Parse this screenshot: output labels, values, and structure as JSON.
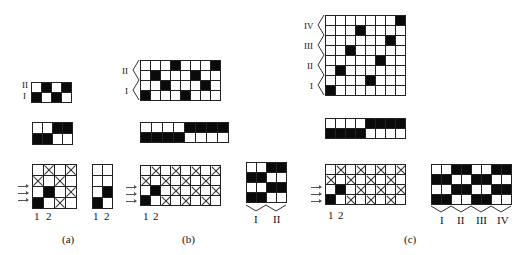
{
  "figure": {
    "panels": [
      {
        "id": "a",
        "caption": "(a)",
        "threading": {
          "rows": 2,
          "cols": 4,
          "row_labels": [
            "II",
            "I"
          ],
          "cells": [
            [
              0,
              1,
              0,
              1
            ],
            [
              1,
              0,
              1,
              0
            ]
          ]
        },
        "tieup": {
          "rows": 2,
          "cols": 4,
          "cells": [
            [
              0,
              0,
              1,
              1
            ],
            [
              1,
              1,
              0,
              0
            ]
          ]
        },
        "drawdown": {
          "rows": 4,
          "cols": 4,
          "col_labels": [
            "1",
            "2"
          ],
          "cells": [
            [
              0,
              2,
              0,
              2
            ],
            [
              2,
              0,
              2,
              0
            ],
            [
              0,
              1,
              0,
              2
            ],
            [
              1,
              0,
              2,
              0
            ]
          ]
        },
        "treadling": {
          "rows": 4,
          "cols": 2,
          "col_labels": [
            "1",
            "2"
          ],
          "cells": [
            [
              0,
              0
            ],
            [
              0,
              0
            ],
            [
              0,
              1
            ],
            [
              1,
              0
            ]
          ]
        }
      },
      {
        "id": "b",
        "caption": "(b)",
        "threading": {
          "rows": 4,
          "cols": 8,
          "row_labels": [
            "II",
            "I"
          ],
          "cells": [
            [
              0,
              0,
              0,
              1,
              0,
              0,
              0,
              1
            ],
            [
              0,
              1,
              0,
              0,
              0,
              1,
              0,
              0
            ],
            [
              0,
              0,
              1,
              0,
              0,
              0,
              1,
              0
            ],
            [
              1,
              0,
              0,
              0,
              1,
              0,
              0,
              0
            ]
          ]
        },
        "tieup": {
          "rows": 2,
          "cols": 8,
          "cells": [
            [
              0,
              0,
              0,
              0,
              1,
              1,
              1,
              1
            ],
            [
              1,
              1,
              1,
              1,
              0,
              0,
              0,
              0
            ]
          ]
        },
        "drawdown": {
          "rows": 4,
          "cols": 8,
          "col_labels": [
            "1",
            "2"
          ],
          "cells": [
            [
              0,
              2,
              0,
              2,
              0,
              2,
              0,
              2
            ],
            [
              2,
              0,
              2,
              0,
              2,
              0,
              2,
              0
            ],
            [
              0,
              1,
              0,
              2,
              0,
              2,
              0,
              2
            ],
            [
              1,
              0,
              2,
              0,
              2,
              0,
              2,
              0
            ]
          ]
        },
        "pattern": {
          "rows": 4,
          "cols": 4,
          "unit_labels": [
            "I",
            "II"
          ],
          "cells": [
            [
              0,
              0,
              1,
              1
            ],
            [
              1,
              1,
              0,
              0
            ],
            [
              0,
              0,
              1,
              1
            ],
            [
              1,
              1,
              0,
              0
            ]
          ]
        }
      },
      {
        "id": "c",
        "caption": "(c)",
        "threading": {
          "rows": 8,
          "cols": 8,
          "row_labels": [
            "IV",
            "III",
            "II",
            "I"
          ],
          "cells": [
            [
              0,
              0,
              0,
              0,
              0,
              0,
              0,
              1
            ],
            [
              0,
              0,
              0,
              1,
              0,
              0,
              0,
              0
            ],
            [
              0,
              0,
              0,
              0,
              0,
              0,
              1,
              0
            ],
            [
              0,
              0,
              1,
              0,
              0,
              0,
              0,
              0
            ],
            [
              0,
              0,
              0,
              0,
              0,
              1,
              0,
              0
            ],
            [
              0,
              1,
              0,
              0,
              0,
              0,
              0,
              0
            ],
            [
              0,
              0,
              0,
              0,
              1,
              0,
              0,
              0
            ],
            [
              1,
              0,
              0,
              0,
              0,
              0,
              0,
              0
            ]
          ]
        },
        "tieup": {
          "rows": 2,
          "cols": 8,
          "cells": [
            [
              0,
              0,
              0,
              0,
              1,
              1,
              1,
              1
            ],
            [
              1,
              1,
              1,
              1,
              0,
              0,
              0,
              0
            ]
          ]
        },
        "drawdown": {
          "rows": 4,
          "cols": 8,
          "col_labels": [
            "1",
            "2"
          ],
          "cells": [
            [
              0,
              2,
              0,
              2,
              0,
              2,
              0,
              2
            ],
            [
              2,
              0,
              2,
              0,
              2,
              0,
              2,
              0
            ],
            [
              0,
              1,
              0,
              2,
              0,
              2,
              0,
              2
            ],
            [
              1,
              0,
              2,
              0,
              2,
              0,
              2,
              0
            ]
          ]
        },
        "pattern": {
          "rows": 4,
          "cols": 8,
          "unit_labels": [
            "I",
            "II",
            "III",
            "IV"
          ],
          "cells": [
            [
              0,
              0,
              1,
              1,
              0,
              0,
              1,
              1
            ],
            [
              1,
              1,
              0,
              0,
              1,
              1,
              0,
              0
            ],
            [
              0,
              0,
              1,
              1,
              0,
              0,
              1,
              1
            ],
            [
              1,
              1,
              0,
              0,
              1,
              1,
              0,
              0
            ]
          ]
        }
      }
    ],
    "legend": {
      "0": "empty",
      "1": "black",
      "2": "crossed"
    }
  }
}
